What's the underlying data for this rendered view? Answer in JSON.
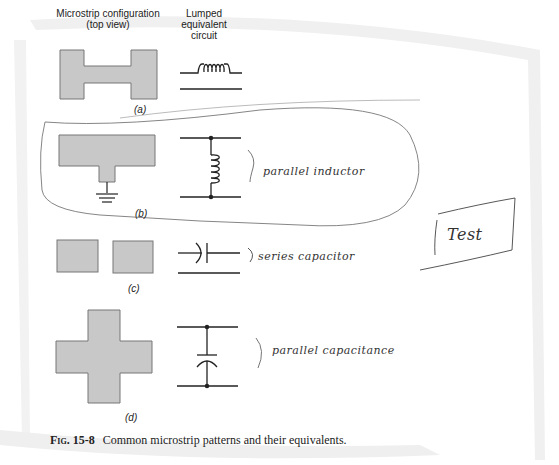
{
  "headers": {
    "microstrip": "Microstrip configuration\n(top view)",
    "microstrip_line1": "Microstrip configuration",
    "microstrip_line2": "(top view)",
    "lumped_line1": "Lumped equivalent",
    "lumped_line2": "circuit"
  },
  "panels": [
    {
      "id": "a",
      "label": "(a)",
      "microstrip": "h-shape",
      "circuit": "series-inductor",
      "annotation": ""
    },
    {
      "id": "b",
      "label": "(b)",
      "microstrip": "t-shape-to-ground",
      "circuit": "parallel-inductor",
      "annotation": "parallel inductor"
    },
    {
      "id": "c",
      "label": "(c)",
      "microstrip": "gap-squares",
      "circuit": "series-capacitor",
      "annotation": "series capacitor"
    },
    {
      "id": "d",
      "label": "(d)",
      "microstrip": "cross-shape",
      "circuit": "parallel-capacitor",
      "annotation": "parallel capacitance"
    }
  ],
  "handwritten_box": "Test",
  "caption": {
    "figure": "Fig. 15-8",
    "text": "Common microstrip patterns and their equivalents."
  },
  "colors": {
    "strip_fill": "#c8c8c8",
    "strip_edge": "#777777",
    "ink": "#222222",
    "pencil": "#555555",
    "page_shadow": "#eeeeee"
  }
}
